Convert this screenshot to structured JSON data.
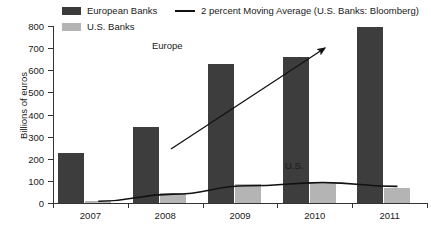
{
  "chart_data": {
    "type": "bar",
    "title": "",
    "subtitle": "",
    "xlabel": "",
    "ylabel": "Billions of euros",
    "categories": [
      "2007",
      "2008",
      "2009",
      "2010",
      "2011"
    ],
    "ylim": [
      0,
      800
    ],
    "yticks": [
      0,
      100,
      200,
      300,
      400,
      500,
      600,
      700,
      800
    ],
    "ytick_labels": [
      "0",
      "100",
      "200",
      "300",
      "400",
      "500",
      "600",
      "700",
      "800"
    ],
    "grid": false,
    "legend_position": "top",
    "series": [
      {
        "name": "European Banks",
        "color": "#3d3d3d",
        "values": [
          225,
          345,
          628,
          660,
          797
        ]
      },
      {
        "name": "U.S. Banks",
        "color": "#b4b4b4",
        "values": [
          10,
          45,
          85,
          85,
          70
        ]
      },
      {
        "name": "2 percent Moving Average (U.S. Banks: Bloomberg)",
        "type": "line",
        "color": "#111111",
        "values": [
          8,
          40,
          78,
          92,
          75
        ]
      }
    ],
    "annotations": [
      {
        "text": "Europe",
        "x": 2008.6,
        "y": 690
      },
      {
        "text": "U.S.",
        "x": 2010.1,
        "y": 145
      }
    ],
    "trend_arrow": {
      "label": "Europe rising trend",
      "from": {
        "x": 2007.85,
        "y": 245
      },
      "to": {
        "x": 2009.95,
        "y": 700
      }
    }
  },
  "legend": {
    "european_banks": "European Banks",
    "us_banks": "U.S. Banks",
    "moving_average": "2 percent Moving Average (U.S. Banks: Bloomberg)"
  },
  "axes": {
    "y_axis_title": "Billions of euros",
    "y_tick_labels": [
      "800",
      "700",
      "600",
      "500",
      "400",
      "300",
      "200",
      "100",
      "0"
    ],
    "x_tick_labels": [
      "2007",
      "2008",
      "2009",
      "2010",
      "2011"
    ]
  },
  "annotations": {
    "europe": "Europe",
    "us": "U.S."
  },
  "colors": {
    "european_banks": "#3d3d3d",
    "us_banks": "#b4b4b4",
    "moving_average_line": "#111111",
    "axis": "#333333",
    "background": "#ffffff"
  }
}
